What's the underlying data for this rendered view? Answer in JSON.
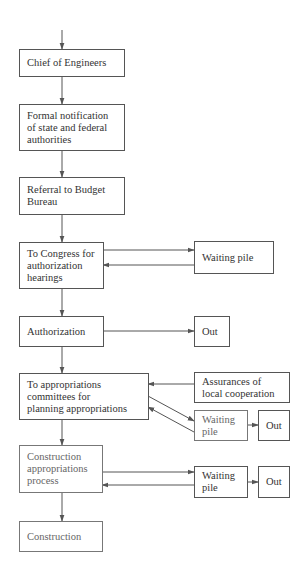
{
  "diagram": {
    "type": "flowchart",
    "colors": {
      "line": "#555555",
      "text": "#333333",
      "background": "#ffffff"
    },
    "main_flow": [
      {
        "id": "chief",
        "label": "Chief of Engineers"
      },
      {
        "id": "notification",
        "label": "Formal notification\nof state and federal\nauthorities"
      },
      {
        "id": "referral",
        "label": "Referral to Budget\nBureau"
      },
      {
        "id": "congress",
        "label": "To Congress for\nauthorization\nhearings"
      },
      {
        "id": "authorization",
        "label": "Authorization"
      },
      {
        "id": "appropriations_committees",
        "label": "To appropriations\ncommittees for\nplanning appropriations"
      },
      {
        "id": "construction_appropriations",
        "label": "Construction\nappropriations\nprocess"
      },
      {
        "id": "construction",
        "label": "Construction"
      }
    ],
    "side_nodes": [
      {
        "id": "waiting1",
        "label": "Waiting pile"
      },
      {
        "id": "out1",
        "label": "Out"
      },
      {
        "id": "assurances",
        "label": "Assurances of\nlocal cooperation"
      },
      {
        "id": "waiting2",
        "label": "Waiting\npile"
      },
      {
        "id": "out2",
        "label": "Out"
      },
      {
        "id": "waiting3",
        "label": "Waiting\npile"
      },
      {
        "id": "out3",
        "label": "Out"
      }
    ],
    "edges": [
      {
        "from": "start",
        "to": "chief"
      },
      {
        "from": "chief",
        "to": "notification"
      },
      {
        "from": "notification",
        "to": "referral"
      },
      {
        "from": "referral",
        "to": "congress"
      },
      {
        "from": "congress",
        "to": "waiting1"
      },
      {
        "from": "waiting1",
        "to": "congress"
      },
      {
        "from": "congress",
        "to": "authorization"
      },
      {
        "from": "authorization",
        "to": "out1"
      },
      {
        "from": "authorization",
        "to": "appropriations_committees"
      },
      {
        "from": "assurances",
        "to": "appropriations_committees"
      },
      {
        "from": "appropriations_committees",
        "to": "waiting2"
      },
      {
        "from": "waiting2",
        "to": "appropriations_committees"
      },
      {
        "from": "waiting2",
        "to": "out2"
      },
      {
        "from": "appropriations_committees",
        "to": "construction_appropriations"
      },
      {
        "from": "construction_appropriations",
        "to": "waiting3"
      },
      {
        "from": "waiting3",
        "to": "construction_appropriations"
      },
      {
        "from": "waiting3",
        "to": "out3"
      },
      {
        "from": "construction_appropriations",
        "to": "construction"
      }
    ]
  }
}
